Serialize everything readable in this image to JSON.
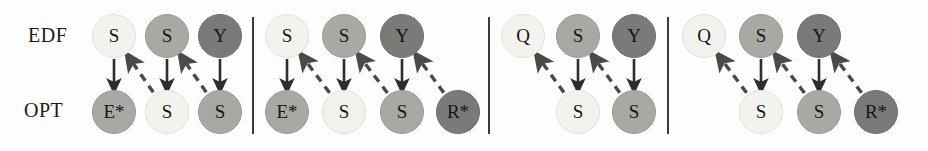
{
  "figure": {
    "row_labels": [
      {
        "name": "edf",
        "text": "EDF",
        "x": 28,
        "y": 24
      },
      {
        "name": "opt",
        "text": "OPT",
        "x": 24,
        "y": 99
      }
    ],
    "geometry": {
      "width": 928,
      "height": 151,
      "top_row_cy": 36,
      "bottom_row_cy": 112,
      "node_diameter": 44
    },
    "palette": {
      "shade_light": "#f2f2ee",
      "shade_light_border": "#e2e2dc",
      "shade_medium": "#a8a8a4",
      "shade_medium_border": "#9a9a96",
      "shade_dark": "#7a7a79",
      "shade_dark_border": "#6e6e6d",
      "text": "#161616",
      "arrow_solid": "#2e2e2e",
      "arrow_dashed": "#4a4a4a",
      "separator": "#3a3a3a",
      "background": "#fdfdfc"
    },
    "separators": [
      {
        "name": "separator-1",
        "x": 253,
        "y1": 17,
        "y2": 134
      },
      {
        "name": "separator-2",
        "x": 489,
        "y1": 17,
        "y2": 134
      },
      {
        "name": "separator-3",
        "x": 668,
        "y1": 17,
        "y2": 134
      }
    ],
    "panels": [
      {
        "name": "panel-1",
        "index": 1,
        "edf_nodes": [
          {
            "label": "S",
            "shade": "light",
            "cx": 114
          },
          {
            "label": "S",
            "shade": "medium",
            "cx": 167
          },
          {
            "label": "Y",
            "shade": "dark",
            "cx": 220
          }
        ],
        "opt_nodes": [
          {
            "label": "E*",
            "shade": "medium",
            "cx": 114
          },
          {
            "label": "S",
            "shade": "light",
            "cx": 167
          },
          {
            "label": "S",
            "shade": "medium",
            "cx": 220
          }
        ],
        "solid_arrows": [
          {
            "from_cx": 114,
            "to_cx": 114
          },
          {
            "from_cx": 167,
            "to_cx": 167
          },
          {
            "from_cx": 220,
            "to_cx": 220
          }
        ],
        "dashed_arrows": [
          {
            "from_cx": 167,
            "to_cx": 114
          },
          {
            "from_cx": 220,
            "to_cx": 167
          }
        ]
      },
      {
        "name": "panel-2",
        "index": 2,
        "edf_nodes": [
          {
            "label": "S",
            "shade": "light",
            "cx": 287
          },
          {
            "label": "S",
            "shade": "medium",
            "cx": 344
          },
          {
            "label": "Y",
            "shade": "dark",
            "cx": 402
          }
        ],
        "opt_nodes": [
          {
            "label": "E*",
            "shade": "medium",
            "cx": 287
          },
          {
            "label": "S",
            "shade": "light",
            "cx": 344
          },
          {
            "label": "S",
            "shade": "medium",
            "cx": 402
          },
          {
            "label": "R*",
            "shade": "dark",
            "cx": 458
          }
        ],
        "solid_arrows": [
          {
            "from_cx": 287,
            "to_cx": 287
          },
          {
            "from_cx": 344,
            "to_cx": 344
          },
          {
            "from_cx": 402,
            "to_cx": 402
          }
        ],
        "dashed_arrows": [
          {
            "from_cx": 344,
            "to_cx": 287
          },
          {
            "from_cx": 402,
            "to_cx": 344
          },
          {
            "from_cx": 458,
            "to_cx": 402
          }
        ]
      },
      {
        "name": "panel-3",
        "index": 3,
        "edf_nodes": [
          {
            "label": "Q",
            "shade": "light",
            "cx": 523
          },
          {
            "label": "S",
            "shade": "medium",
            "cx": 578
          },
          {
            "label": "Y",
            "shade": "dark",
            "cx": 634
          }
        ],
        "opt_nodes": [
          {
            "label": "S",
            "shade": "light",
            "cx": 578
          },
          {
            "label": "S",
            "shade": "medium",
            "cx": 634
          }
        ],
        "solid_arrows": [
          {
            "from_cx": 578,
            "to_cx": 578
          },
          {
            "from_cx": 634,
            "to_cx": 634
          }
        ],
        "dashed_arrows": [
          {
            "from_cx": 578,
            "to_cx": 523
          },
          {
            "from_cx": 634,
            "to_cx": 578
          }
        ]
      },
      {
        "name": "panel-4",
        "index": 4,
        "edf_nodes": [
          {
            "label": "Q",
            "shade": "light",
            "cx": 704
          },
          {
            "label": "S",
            "shade": "medium",
            "cx": 761
          },
          {
            "label": "Y",
            "shade": "dark",
            "cx": 819
          }
        ],
        "opt_nodes": [
          {
            "label": "S",
            "shade": "light",
            "cx": 761
          },
          {
            "label": "S",
            "shade": "medium",
            "cx": 819
          },
          {
            "label": "R*",
            "shade": "dark",
            "cx": 876
          }
        ],
        "solid_arrows": [
          {
            "from_cx": 761,
            "to_cx": 761
          },
          {
            "from_cx": 819,
            "to_cx": 819
          }
        ],
        "dashed_arrows": [
          {
            "from_cx": 761,
            "to_cx": 704
          },
          {
            "from_cx": 819,
            "to_cx": 761
          },
          {
            "from_cx": 876,
            "to_cx": 819
          }
        ]
      }
    ]
  }
}
